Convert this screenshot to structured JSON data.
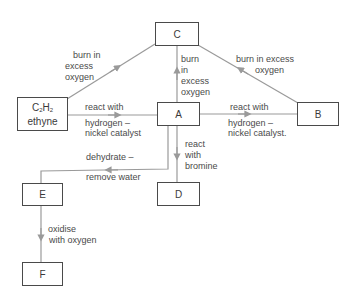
{
  "diagram": {
    "type": "reaction-scheme",
    "line_color": "#9a9a9a",
    "box_border_color": "#4a4a4a",
    "nodes": [
      {
        "id": "C",
        "label": "C"
      },
      {
        "id": "ethyne",
        "formula_main": "C",
        "formula_sub1": "2",
        "formula_h": "H",
        "formula_sub2": "2",
        "name": "ethyne"
      },
      {
        "id": "A",
        "label": "A"
      },
      {
        "id": "B",
        "label": "B"
      },
      {
        "id": "E",
        "label": "E"
      },
      {
        "id": "D",
        "label": "D"
      },
      {
        "id": "F",
        "label": "F"
      }
    ],
    "edges": [
      {
        "from": "ethyne",
        "to": "C",
        "label_lines": [
          "burn in",
          "excess",
          "oxygen"
        ]
      },
      {
        "from": "ethyne",
        "to": "A",
        "label_top": "react with",
        "label_bottom_lines": [
          "hydrogen –",
          "nickel catalyst"
        ]
      },
      {
        "from": "A",
        "to": "C",
        "label_lines": [
          "burn",
          "in",
          "excess",
          "oxygen"
        ]
      },
      {
        "from": "C",
        "to": "B",
        "label_lines": [
          "burn in excess",
          "oxygen"
        ],
        "direction_note": "arrow points toward C"
      },
      {
        "from": "A",
        "to": "B",
        "label_top": "react with",
        "label_bottom_lines": [
          "hydrogen –",
          "nickel catalyst."
        ]
      },
      {
        "from": "A",
        "to": "D",
        "label_lines": [
          "react",
          "with",
          "bromine"
        ]
      },
      {
        "from": "A",
        "to": "E",
        "label_top": "dehydrate –",
        "label_bottom": "remove water"
      },
      {
        "from": "E",
        "to": "F",
        "label_lines": [
          "oxidise",
          "with oxygen"
        ]
      }
    ]
  }
}
